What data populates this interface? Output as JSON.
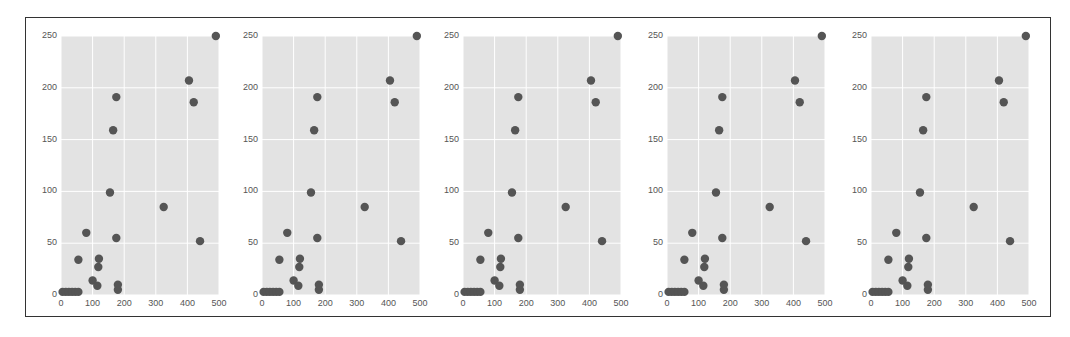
{
  "chart_data": [
    {
      "type": "scatter",
      "title": "",
      "xlabel": "",
      "ylabel": "",
      "xlim": [
        0,
        500
      ],
      "ylim": [
        0,
        250
      ],
      "grid": true,
      "xticks": [
        "0",
        "100",
        "200",
        "300",
        "400",
        "500"
      ],
      "yticks": [
        "0",
        "50",
        "100",
        "150",
        "200",
        "250"
      ],
      "x": [
        5,
        15,
        25,
        35,
        45,
        55,
        55,
        80,
        100,
        115,
        118,
        120,
        155,
        165,
        175,
        175,
        180,
        180,
        325,
        405,
        420,
        440,
        490
      ],
      "y": [
        3,
        3,
        3,
        3,
        3,
        3,
        34,
        60,
        14,
        9,
        27,
        35,
        99,
        159,
        55,
        191,
        5,
        10,
        85,
        207,
        186,
        52,
        250
      ]
    },
    {
      "type": "scatter",
      "title": "",
      "xlabel": "",
      "ylabel": "",
      "xlim": [
        0,
        500
      ],
      "ylim": [
        0,
        250
      ],
      "grid": true,
      "xticks": [
        "0",
        "100",
        "200",
        "300",
        "400",
        "500"
      ],
      "yticks": [
        "0",
        "50",
        "100",
        "150",
        "200",
        "250"
      ],
      "x": [
        5,
        15,
        25,
        35,
        45,
        55,
        55,
        80,
        100,
        115,
        118,
        120,
        155,
        165,
        175,
        175,
        180,
        180,
        325,
        405,
        420,
        440,
        490
      ],
      "y": [
        3,
        3,
        3,
        3,
        3,
        3,
        34,
        60,
        14,
        9,
        27,
        35,
        99,
        159,
        55,
        191,
        5,
        10,
        85,
        207,
        186,
        52,
        250
      ]
    },
    {
      "type": "scatter",
      "title": "",
      "xlabel": "",
      "ylabel": "",
      "xlim": [
        0,
        500
      ],
      "ylim": [
        0,
        250
      ],
      "grid": true,
      "xticks": [
        "0",
        "100",
        "200",
        "300",
        "400",
        "500"
      ],
      "yticks": [
        "0",
        "50",
        "100",
        "150",
        "200",
        "250"
      ],
      "x": [
        5,
        15,
        25,
        35,
        45,
        55,
        55,
        80,
        100,
        115,
        118,
        120,
        155,
        165,
        175,
        175,
        180,
        180,
        325,
        405,
        420,
        440,
        490
      ],
      "y": [
        3,
        3,
        3,
        3,
        3,
        3,
        34,
        60,
        14,
        9,
        27,
        35,
        99,
        159,
        55,
        191,
        5,
        10,
        85,
        207,
        186,
        52,
        250
      ]
    },
    {
      "type": "scatter",
      "title": "",
      "xlabel": "",
      "ylabel": "",
      "xlim": [
        0,
        500
      ],
      "ylim": [
        0,
        250
      ],
      "grid": true,
      "xticks": [
        "0",
        "100",
        "200",
        "300",
        "400",
        "500"
      ],
      "yticks": [
        "0",
        "50",
        "100",
        "150",
        "200",
        "250"
      ],
      "x": [
        5,
        15,
        25,
        35,
        45,
        55,
        55,
        80,
        100,
        115,
        118,
        120,
        155,
        165,
        175,
        175,
        180,
        180,
        325,
        405,
        420,
        440,
        490
      ],
      "y": [
        3,
        3,
        3,
        3,
        3,
        3,
        34,
        60,
        14,
        9,
        27,
        35,
        99,
        159,
        55,
        191,
        5,
        10,
        85,
        207,
        186,
        52,
        250
      ]
    },
    {
      "type": "scatter",
      "title": "",
      "xlabel": "",
      "ylabel": "",
      "xlim": [
        0,
        500
      ],
      "ylim": [
        0,
        250
      ],
      "grid": true,
      "xticks": [
        "0",
        "100",
        "200",
        "300",
        "400",
        "500"
      ],
      "yticks": [
        "0",
        "50",
        "100",
        "150",
        "200",
        "250"
      ],
      "x": [
        5,
        15,
        25,
        35,
        45,
        55,
        55,
        80,
        100,
        115,
        118,
        120,
        155,
        165,
        175,
        175,
        180,
        180,
        325,
        405,
        420,
        440,
        490
      ],
      "y": [
        3,
        3,
        3,
        3,
        3,
        3,
        34,
        60,
        14,
        9,
        27,
        35,
        99,
        159,
        55,
        191,
        5,
        10,
        85,
        207,
        186,
        52,
        250
      ]
    }
  ],
  "style": {
    "plot_bg": "#e3e3e3",
    "grid_color": "#ffffff",
    "marker_color": "#555555",
    "text_color": "#555555",
    "frame_color": "#333333"
  }
}
